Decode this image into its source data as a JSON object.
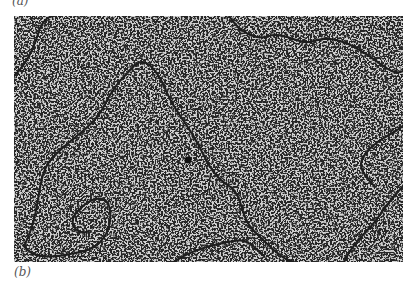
{
  "figure": {
    "panel_a_label": "(a)",
    "panel_b_label": "(b)",
    "image": {
      "description": "electron micrograph of a long DNA molecule strand on speckled grey background",
      "background_color": "#cfcfcf",
      "speckle_color": "#2a2a2a",
      "strand_color": "#222222"
    }
  }
}
